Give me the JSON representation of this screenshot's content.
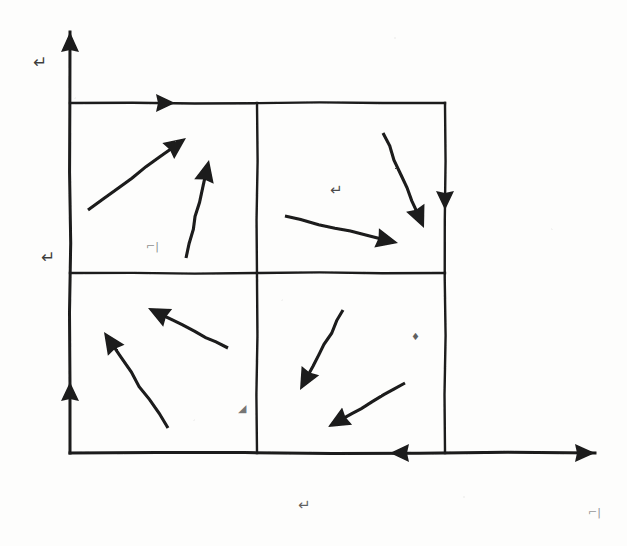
{
  "document": {
    "kind": "hand-drawn-sketch",
    "title": "Vector field quadrant sketch",
    "ink_color": "#1a1a1a",
    "paper_color": "#fdfdfc"
  },
  "axes": {
    "origin": {
      "x": 70,
      "y": 453
    },
    "y_axis": {
      "name": "vertical-axis",
      "from": {
        "x": 70,
        "y": 453
      },
      "to": {
        "x": 70,
        "y": 32
      },
      "arrowhead": "up"
    },
    "x_axis": {
      "name": "horizontal-axis",
      "from": {
        "x": 70,
        "y": 453
      },
      "to": {
        "x": 595,
        "y": 453
      },
      "arrowhead": "right"
    }
  },
  "box": {
    "left": 70,
    "right": 445,
    "top": 103,
    "bottom": 453,
    "mid_x": 257,
    "mid_y": 273
  },
  "grid_lines": [
    {
      "name": "box-top-edge",
      "x1": 70,
      "y1": 103,
      "x2": 445,
      "y2": 103
    },
    {
      "name": "box-right-edge",
      "x1": 445,
      "y1": 103,
      "x2": 445,
      "y2": 453
    },
    {
      "name": "box-middle-horizontal",
      "x1": 70,
      "y1": 273,
      "x2": 445,
      "y2": 273
    },
    {
      "name": "box-middle-vertical",
      "x1": 257,
      "y1": 103,
      "x2": 257,
      "y2": 453
    }
  ],
  "boundary_markers": [
    {
      "name": "top-edge-right-marker",
      "x": 175,
      "y": 103,
      "direction": "right"
    },
    {
      "name": "right-edge-down-marker",
      "x": 445,
      "y": 210,
      "direction": "down"
    },
    {
      "name": "left-axis-up-marker",
      "x": 70,
      "y": 382,
      "direction": "up"
    },
    {
      "name": "bottom-axis-left-marker",
      "x": 390,
      "y": 453,
      "direction": "left"
    }
  ],
  "vectors": [
    {
      "name": "vector-q2-long",
      "quadrant": "top-left",
      "tail": {
        "x": 88,
        "y": 210
      },
      "head": {
        "x": 186,
        "y": 138
      },
      "direction": "up-right"
    },
    {
      "name": "vector-q2-steep",
      "quadrant": "top-left",
      "tail": {
        "x": 186,
        "y": 258
      },
      "head": {
        "x": 209,
        "y": 160
      },
      "direction": "up-right-steep"
    },
    {
      "name": "vector-q1-shallow",
      "quadrant": "top-right",
      "tail": {
        "x": 285,
        "y": 216
      },
      "head": {
        "x": 398,
        "y": 243
      },
      "direction": "right-down-shallow"
    },
    {
      "name": "vector-q1-steep",
      "quadrant": "top-right",
      "tail": {
        "x": 383,
        "y": 133
      },
      "head": {
        "x": 424,
        "y": 228
      },
      "direction": "down-right-steep"
    },
    {
      "name": "vector-q3-shallow",
      "quadrant": "bottom-left",
      "tail": {
        "x": 228,
        "y": 348
      },
      "head": {
        "x": 148,
        "y": 308
      },
      "direction": "up-left-shallow"
    },
    {
      "name": "vector-q3-steep",
      "quadrant": "bottom-left",
      "tail": {
        "x": 168,
        "y": 428
      },
      "head": {
        "x": 104,
        "y": 332
      },
      "direction": "up-left-steep"
    },
    {
      "name": "vector-q4-steep",
      "quadrant": "bottom-right",
      "tail": {
        "x": 343,
        "y": 310
      },
      "head": {
        "x": 300,
        "y": 390
      },
      "direction": "down-left-steep"
    },
    {
      "name": "vector-q4-shallow",
      "quadrant": "bottom-right",
      "tail": {
        "x": 405,
        "y": 383
      },
      "head": {
        "x": 328,
        "y": 427
      },
      "direction": "down-left-shallow"
    }
  ],
  "annotations": [
    {
      "name": "label-y-axis-top",
      "glyph": "↵",
      "x": 33,
      "y": 68,
      "size": 17,
      "opacity": 0.85
    },
    {
      "name": "label-y-axis-middle",
      "glyph": "↵",
      "x": 41,
      "y": 263,
      "size": 17,
      "opacity": 0.85
    },
    {
      "name": "label-q2-inner",
      "glyph": "⌐|",
      "x": 146,
      "y": 250,
      "size": 11,
      "opacity": 0.55
    },
    {
      "name": "label-q1-inner",
      "glyph": "↵",
      "x": 330,
      "y": 195,
      "size": 15,
      "opacity": 0.8
    },
    {
      "name": "label-q3-inner",
      "glyph": "◢",
      "x": 238,
      "y": 412,
      "size": 11,
      "opacity": 0.6
    },
    {
      "name": "label-q4-inner",
      "glyph": "♦",
      "x": 411,
      "y": 340,
      "size": 10,
      "opacity": 0.7
    },
    {
      "name": "label-x-axis-center",
      "glyph": "↵",
      "x": 298,
      "y": 510,
      "size": 15,
      "opacity": 0.7
    },
    {
      "name": "label-x-axis-right",
      "glyph": "⌐|",
      "x": 588,
      "y": 516,
      "size": 11,
      "opacity": 0.5
    }
  ]
}
